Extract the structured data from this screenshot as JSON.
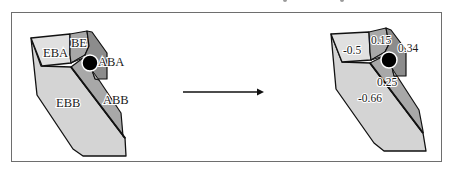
{
  "figure": {
    "left_diagram": {
      "title": "region-labels",
      "regions": [
        {
          "id": "EBA",
          "label": "EBA"
        },
        {
          "id": "BE",
          "label": "BE"
        },
        {
          "id": "ABA",
          "label": "ABA"
        },
        {
          "id": "EBB",
          "label": "EBB"
        },
        {
          "id": "ABB",
          "label": "ABB"
        }
      ]
    },
    "right_diagram": {
      "title": "region-values",
      "regions": [
        {
          "id": "EBA",
          "value": "-0.5"
        },
        {
          "id": "BE",
          "value": "0.15"
        },
        {
          "id": "ABA",
          "value": "0.34"
        },
        {
          "id": "ABB",
          "value": "0.25"
        },
        {
          "id": "EBB",
          "value": "-0.66"
        }
      ]
    },
    "arrow": {
      "direction": "right"
    },
    "colors": {
      "light_region": "#d4d4d4",
      "mid_region": "#a8a8a8",
      "dark_region": "#8c8c8c",
      "lightest_region": "#e0e0e0",
      "outline": "#111111",
      "marker": "#000000",
      "frame": "#6e6e6e"
    }
  }
}
